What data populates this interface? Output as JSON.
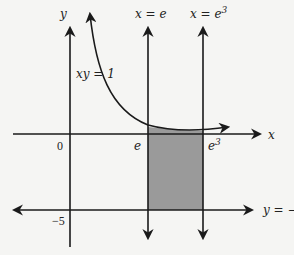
{
  "diagram": {
    "type": "region-between-curves",
    "labels": {
      "y_axis": "y",
      "x_axis": "x",
      "curve": "xy = 1",
      "line_e": "x = e",
      "line_e3_prefix": "x = e",
      "line_e3_exp": "3",
      "line_y": "y = −5",
      "origin": "0",
      "tick_e": "e",
      "tick_e3_base": "e",
      "tick_e3_exp": "3",
      "tick_neg5": "−5"
    },
    "colors": {
      "stroke": "#1a1a1a",
      "shade": "#9a9a9a",
      "background": "#f5f5f3"
    },
    "shaded_region": "between y = 1/x and y = −5 for e ≤ x ≤ e³"
  }
}
